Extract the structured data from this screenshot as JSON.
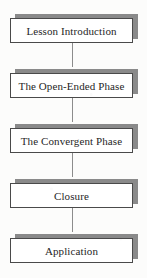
{
  "diagram": {
    "type": "vertical-flowchart",
    "orientation": "top-to-bottom",
    "background_color": "#fcfcfb",
    "box_fill_color": "#ffffff",
    "box_border_color": "#4a4a4a",
    "shadow_color": "#8a8a8a",
    "connector_color": "#8c8c8c",
    "text_color": "#262626",
    "nodes": [
      {
        "id": "node-1",
        "label": "Lesson Introduction"
      },
      {
        "id": "node-2",
        "label": "The Open-Ended Phase"
      },
      {
        "id": "node-3",
        "label": "The Convergent Phase"
      },
      {
        "id": "node-4",
        "label": "Closure"
      },
      {
        "id": "node-5",
        "label": "Application"
      }
    ],
    "connectors": [
      {
        "id": "connector-1",
        "from": "node-1",
        "to": "node-2"
      },
      {
        "id": "connector-2",
        "from": "node-2",
        "to": "node-3"
      },
      {
        "id": "connector-3",
        "from": "node-3",
        "to": "node-4"
      },
      {
        "id": "connector-4",
        "from": "node-4",
        "to": "node-5"
      }
    ]
  }
}
